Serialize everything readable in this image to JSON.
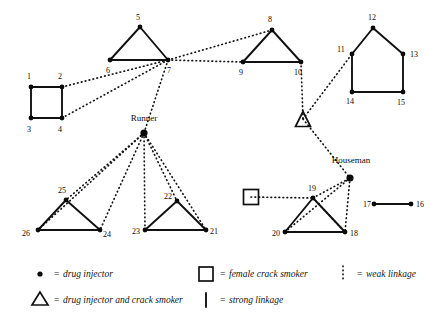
{
  "figure": {
    "names": [
      {
        "id": "runner",
        "label": "Runner",
        "x": 144,
        "y": 121
      },
      {
        "id": "houseman",
        "label": "Houseman",
        "x": 351,
        "y": 163
      }
    ],
    "nodes": [
      {
        "id": "n1",
        "label": "1",
        "x": 31,
        "y": 87,
        "lx": 27,
        "ly": 79,
        "type": "drug-injector"
      },
      {
        "id": "n2",
        "label": "2",
        "x": 62,
        "y": 87,
        "lx": 58,
        "ly": 79,
        "type": "drug-injector"
      },
      {
        "id": "n3",
        "label": "3",
        "x": 31,
        "y": 118,
        "lx": 27,
        "ly": 132,
        "type": "drug-injector"
      },
      {
        "id": "n4",
        "label": "4",
        "x": 62,
        "y": 118,
        "lx": 58,
        "ly": 132,
        "type": "drug-injector"
      },
      {
        "id": "n5",
        "label": "5",
        "x": 140,
        "y": 27,
        "lx": 136,
        "ly": 20,
        "type": "drug-injector"
      },
      {
        "id": "n6",
        "label": "6",
        "x": 110,
        "y": 60,
        "lx": 106,
        "ly": 73,
        "type": "drug-injector"
      },
      {
        "id": "n7",
        "label": "7",
        "x": 168,
        "y": 60,
        "lx": 167,
        "ly": 73,
        "type": "drug-injector"
      },
      {
        "id": "n8",
        "label": "8",
        "x": 272,
        "y": 30,
        "lx": 268,
        "ly": 22,
        "type": "drug-injector"
      },
      {
        "id": "n9",
        "label": "9",
        "x": 243,
        "y": 62,
        "lx": 239,
        "ly": 75,
        "type": "drug-injector"
      },
      {
        "id": "n10",
        "label": "10",
        "x": 301,
        "y": 62,
        "lx": 294,
        "ly": 75,
        "type": "drug-injector"
      },
      {
        "id": "n11",
        "label": "11",
        "x": 352,
        "y": 54,
        "lx": 337,
        "ly": 52,
        "type": "drug-injector"
      },
      {
        "id": "n12",
        "label": "12",
        "x": 373,
        "y": 28,
        "lx": 368,
        "ly": 20,
        "type": "drug-injector"
      },
      {
        "id": "n13",
        "label": "13",
        "x": 403,
        "y": 54,
        "lx": 410,
        "ly": 57,
        "type": "drug-injector"
      },
      {
        "id": "n14",
        "label": "14",
        "x": 352,
        "y": 92,
        "lx": 346,
        "ly": 104,
        "type": "drug-injector"
      },
      {
        "id": "n15",
        "label": "15",
        "x": 403,
        "y": 92,
        "lx": 397,
        "ly": 105,
        "type": "drug-injector"
      },
      {
        "id": "n16",
        "label": "16",
        "x": 411,
        "y": 204,
        "lx": 416,
        "ly": 207,
        "type": "drug-injector"
      },
      {
        "id": "n17",
        "label": "17",
        "x": 374,
        "y": 204,
        "lx": 363,
        "ly": 207,
        "type": "drug-injector"
      },
      {
        "id": "n18",
        "label": "18",
        "x": 345,
        "y": 232,
        "lx": 350,
        "ly": 236,
        "type": "drug-injector"
      },
      {
        "id": "n19",
        "label": "19",
        "x": 313,
        "y": 198,
        "lx": 308,
        "ly": 191,
        "type": "drug-injector"
      },
      {
        "id": "n20",
        "label": "20",
        "x": 285,
        "y": 232,
        "lx": 272,
        "ly": 236,
        "type": "drug-injector"
      },
      {
        "id": "n21",
        "label": "21",
        "x": 206,
        "y": 230,
        "lx": 210,
        "ly": 234,
        "type": "drug-injector"
      },
      {
        "id": "n22",
        "label": "22",
        "x": 177,
        "y": 201,
        "lx": 164,
        "ly": 199,
        "type": "drug-injector"
      },
      {
        "id": "n23",
        "label": "23",
        "x": 145,
        "y": 230,
        "lx": 132,
        "ly": 234,
        "type": "drug-injector"
      },
      {
        "id": "n24",
        "label": "24",
        "x": 100,
        "y": 230,
        "lx": 103,
        "ly": 237,
        "type": "drug-injector"
      },
      {
        "id": "n25",
        "label": "25",
        "x": 66,
        "y": 200,
        "lx": 58,
        "ly": 193,
        "type": "drug-injector"
      },
      {
        "id": "n26",
        "label": "26",
        "x": 38,
        "y": 230,
        "lx": 22,
        "ly": 236,
        "type": "drug-injector"
      },
      {
        "id": "runner",
        "label": "",
        "x": 144,
        "y": 133,
        "lx": 0,
        "ly": 0,
        "type": "drug-injector"
      },
      {
        "id": "houseman",
        "label": "",
        "x": 350,
        "y": 178,
        "lx": 0,
        "ly": 0,
        "type": "drug-injector"
      }
    ],
    "special_shapes": [
      {
        "id": "triangle-symbol",
        "type": "drug-injector-and-crack-smoker",
        "x": 303,
        "y": 119,
        "size": 15
      },
      {
        "id": "square-symbol",
        "type": "female-crack-smoker",
        "x": 251,
        "y": 197,
        "size": 15
      }
    ],
    "strong_edges": [
      {
        "from": "n1",
        "to": "n2"
      },
      {
        "from": "n1",
        "to": "n3"
      },
      {
        "from": "n2",
        "to": "n4"
      },
      {
        "from": "n3",
        "to": "n4"
      },
      {
        "from": "n5",
        "to": "n6"
      },
      {
        "from": "n5",
        "to": "n7"
      },
      {
        "from": "n6",
        "to": "n7"
      },
      {
        "from": "n8",
        "to": "n9"
      },
      {
        "from": "n8",
        "to": "n10"
      },
      {
        "from": "n9",
        "to": "n10"
      },
      {
        "from": "n12",
        "to": "n11"
      },
      {
        "from": "n12",
        "to": "n13"
      },
      {
        "from": "n11",
        "to": "n14"
      },
      {
        "from": "n13",
        "to": "n15"
      },
      {
        "from": "n14",
        "to": "n15"
      },
      {
        "from": "n17",
        "to": "n16"
      },
      {
        "from": "n19",
        "to": "n20"
      },
      {
        "from": "n19",
        "to": "n18"
      },
      {
        "from": "n20",
        "to": "n18"
      },
      {
        "from": "n22",
        "to": "n23"
      },
      {
        "from": "n22",
        "to": "n21"
      },
      {
        "from": "n23",
        "to": "n21"
      },
      {
        "from": "n25",
        "to": "n26"
      },
      {
        "from": "n25",
        "to": "n24"
      },
      {
        "from": "n26",
        "to": "n24"
      }
    ],
    "weak_edges": [
      {
        "from": "n2",
        "to": "n7"
      },
      {
        "from": "n4",
        "to": "n7"
      },
      {
        "from": "n7",
        "to": "runner"
      },
      {
        "from": "n7",
        "to": "n9"
      },
      {
        "from": "n7",
        "to": "n8"
      },
      {
        "from": "n10",
        "to": "triangle-symbol"
      },
      {
        "from": "triangle-symbol",
        "to": "n11"
      },
      {
        "from": "triangle-symbol",
        "to": "houseman"
      },
      {
        "from": "runner",
        "to": "n26"
      },
      {
        "from": "runner",
        "to": "n25"
      },
      {
        "from": "runner",
        "to": "n24"
      },
      {
        "from": "runner",
        "to": "n23"
      },
      {
        "from": "runner",
        "to": "n22"
      },
      {
        "from": "runner",
        "to": "n21"
      },
      {
        "from": "square-symbol",
        "to": "n19"
      },
      {
        "from": "n19",
        "to": "houseman"
      },
      {
        "from": "n19",
        "to": "n18"
      },
      {
        "from": "houseman",
        "to": "n18"
      },
      {
        "from": "houseman",
        "to": "n20"
      }
    ]
  },
  "legend": {
    "items": [
      {
        "id": "legend-drug-injector",
        "symbol": "dot-icon",
        "eq": "=",
        "text": "drug injector",
        "x": 40,
        "y": 277
      },
      {
        "id": "legend-injector-crack",
        "symbol": "triangle-icon",
        "eq": "=",
        "text": "drug injector and crack smoker",
        "x": 40,
        "y": 303
      },
      {
        "id": "legend-female-crack",
        "symbol": "square-icon",
        "eq": "=",
        "text": "female crack smoker",
        "x": 206,
        "y": 277
      },
      {
        "id": "legend-strong-linkage",
        "symbol": "solid-line-icon",
        "eq": "=",
        "text": "strong linkage",
        "x": 206,
        "y": 303
      },
      {
        "id": "legend-weak-linkage",
        "symbol": "dotted-line-icon",
        "eq": "=",
        "text": "weak linkage",
        "x": 343,
        "y": 277
      }
    ]
  },
  "colors": {
    "ink": "#0a0a0a",
    "background": "#ffffff"
  }
}
